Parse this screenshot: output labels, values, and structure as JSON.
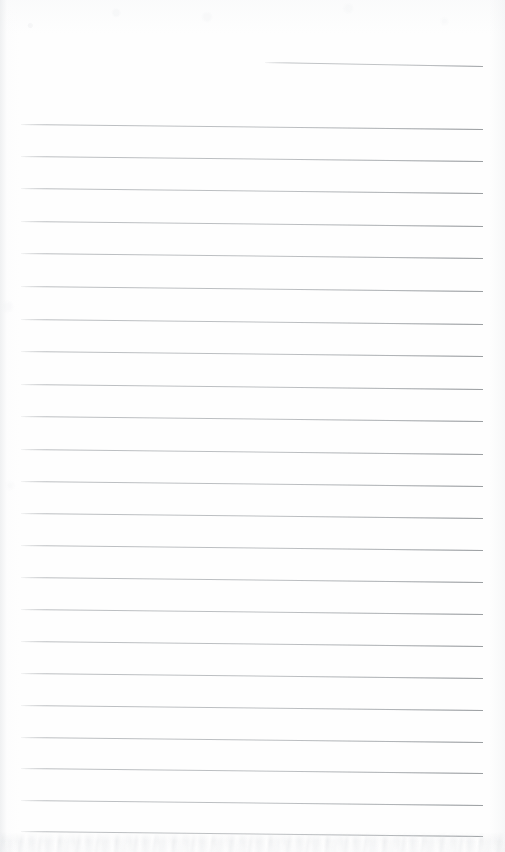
{
  "document": {
    "kind": "scanned-lined-notebook-page",
    "title": "Blank Ruled Notebook Page",
    "page_width": 505,
    "page_height": 852,
    "background_color": "#fefefe",
    "content_text": "",
    "handwriting_present": "none",
    "body_text_lines": []
  },
  "ruling": {
    "rule_color": "#b7babd",
    "rule_thickness_px": 1,
    "rule_left_x": 21,
    "rule_right_x": 483,
    "rule_spacing_px": 32.2,
    "skew_drop_px": 5,
    "full_rule_count": 23,
    "partial_rule_count": 1,
    "total_rule_count": 24
  },
  "lines": [
    {
      "index": 0,
      "label": "partial-rule-top",
      "x": 265,
      "y": 62,
      "width": 218,
      "drop": 4,
      "partial": true
    },
    {
      "index": 1,
      "label": "rule-1",
      "x": 21,
      "y": 124.0,
      "width": 462,
      "drop": 5,
      "partial": false
    },
    {
      "index": 2,
      "label": "rule-2",
      "x": 21,
      "y": 156.0,
      "width": 462,
      "drop": 5,
      "partial": false
    },
    {
      "index": 3,
      "label": "rule-3",
      "x": 21,
      "y": 188.0,
      "width": 462,
      "drop": 5,
      "partial": false
    },
    {
      "index": 4,
      "label": "rule-4",
      "x": 21,
      "y": 220.5,
      "width": 462,
      "drop": 5,
      "partial": false
    },
    {
      "index": 5,
      "label": "rule-5",
      "x": 21,
      "y": 253.0,
      "width": 462,
      "drop": 5,
      "partial": false
    },
    {
      "index": 6,
      "label": "rule-6",
      "x": 21,
      "y": 286.0,
      "width": 462,
      "drop": 5,
      "partial": false
    },
    {
      "index": 7,
      "label": "rule-7",
      "x": 21,
      "y": 318.5,
      "width": 462,
      "drop": 5,
      "partial": false
    },
    {
      "index": 8,
      "label": "rule-8",
      "x": 21,
      "y": 351.0,
      "width": 462,
      "drop": 5,
      "partial": false
    },
    {
      "index": 9,
      "label": "rule-9",
      "x": 21,
      "y": 383.5,
      "width": 462,
      "drop": 5,
      "partial": false
    },
    {
      "index": 10,
      "label": "rule-10",
      "x": 21,
      "y": 416.0,
      "width": 462,
      "drop": 5,
      "partial": false
    },
    {
      "index": 11,
      "label": "rule-11",
      "x": 21,
      "y": 448.5,
      "width": 462,
      "drop": 5,
      "partial": false
    },
    {
      "index": 12,
      "label": "rule-12",
      "x": 21,
      "y": 481.0,
      "width": 462,
      "drop": 5,
      "partial": false
    },
    {
      "index": 13,
      "label": "rule-13",
      "x": 21,
      "y": 513.0,
      "width": 462,
      "drop": 5,
      "partial": false
    },
    {
      "index": 14,
      "label": "rule-14",
      "x": 21,
      "y": 545.0,
      "width": 462,
      "drop": 5,
      "partial": false
    },
    {
      "index": 15,
      "label": "rule-15",
      "x": 21,
      "y": 577.0,
      "width": 462,
      "drop": 5,
      "partial": false
    },
    {
      "index": 16,
      "label": "rule-16",
      "x": 21,
      "y": 609.0,
      "width": 462,
      "drop": 5,
      "partial": false
    },
    {
      "index": 17,
      "label": "rule-17",
      "x": 21,
      "y": 641.0,
      "width": 462,
      "drop": 5,
      "partial": false
    },
    {
      "index": 18,
      "label": "rule-18",
      "x": 21,
      "y": 673.0,
      "width": 462,
      "drop": 5,
      "partial": false
    },
    {
      "index": 19,
      "label": "rule-19",
      "x": 21,
      "y": 705.0,
      "width": 462,
      "drop": 5,
      "partial": false
    },
    {
      "index": 20,
      "label": "rule-20",
      "x": 21,
      "y": 737.0,
      "width": 462,
      "drop": 5,
      "partial": false
    },
    {
      "index": 21,
      "label": "rule-21",
      "x": 21,
      "y": 768.0,
      "width": 462,
      "drop": 5,
      "partial": false
    },
    {
      "index": 22,
      "label": "rule-22",
      "x": 21,
      "y": 800.0,
      "width": 462,
      "drop": 5,
      "partial": false
    },
    {
      "index": 23,
      "label": "rule-23",
      "x": 21,
      "y": 831.0,
      "width": 462,
      "drop": 5,
      "partial": false
    }
  ],
  "artifacts": {
    "bottom_noise_band": {
      "top": 832,
      "height": 20
    },
    "edge_shadow_color": "#e4e6e8"
  }
}
